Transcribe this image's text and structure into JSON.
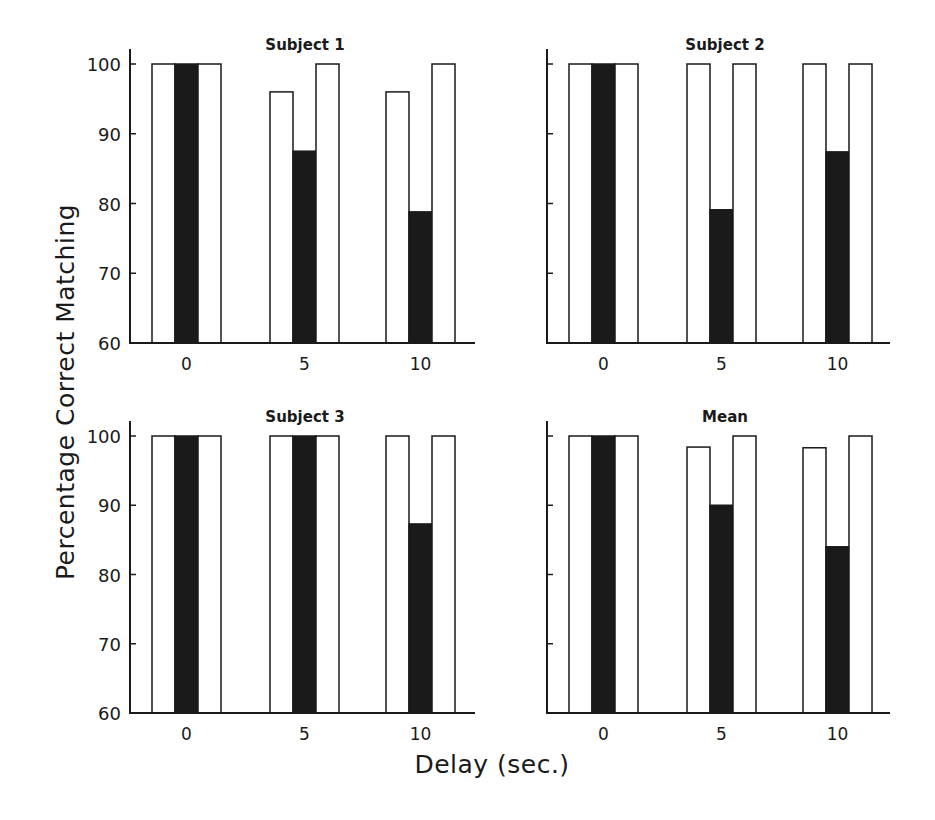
{
  "figure": {
    "ylabel": "Percentage Correct Matching",
    "xlabel": "Delay (sec.)"
  },
  "chart_data": {
    "type": "bar",
    "layout": "2x2 small multiples; each delay group has three adjacent bars (white, black, white)",
    "ylim": [
      60,
      100
    ],
    "yticks": [
      60,
      70,
      80,
      90,
      100
    ],
    "categories": [
      "0",
      "5",
      "10"
    ],
    "xlabel": "Delay (sec.)",
    "ylabel": "Percentage Correct Matching",
    "grid": false,
    "legend": null,
    "colors": {
      "open_bar": "#ffffff",
      "filled_bar": "#1a1a1a",
      "outline": "#1a1a1a"
    },
    "panels": [
      {
        "title": "Subject 1",
        "series": [
          {
            "name": "open-left",
            "fill": "white",
            "values": [
              100,
              96,
              96
            ]
          },
          {
            "name": "filled-center",
            "fill": "black",
            "values": [
              100,
              87.5,
              78.8
            ]
          },
          {
            "name": "open-right",
            "fill": "white",
            "values": [
              100,
              100,
              100
            ]
          }
        ]
      },
      {
        "title": "Subject 2",
        "series": [
          {
            "name": "open-left",
            "fill": "white",
            "values": [
              100,
              100,
              100
            ]
          },
          {
            "name": "filled-center",
            "fill": "black",
            "values": [
              100,
              79.1,
              87.4
            ]
          },
          {
            "name": "open-right",
            "fill": "white",
            "values": [
              100,
              100,
              100
            ]
          }
        ]
      },
      {
        "title": "Subject 3",
        "series": [
          {
            "name": "open-left",
            "fill": "white",
            "values": [
              100,
              100,
              100
            ]
          },
          {
            "name": "filled-center",
            "fill": "black",
            "values": [
              100,
              100,
              87.3
            ]
          },
          {
            "name": "open-right",
            "fill": "white",
            "values": [
              100,
              100,
              100
            ]
          }
        ]
      },
      {
        "title": "Mean",
        "series": [
          {
            "name": "open-left",
            "fill": "white",
            "values": [
              100,
              98.4,
              98.3
            ]
          },
          {
            "name": "filled-center",
            "fill": "black",
            "values": [
              100,
              90.0,
              84.0
            ]
          },
          {
            "name": "open-right",
            "fill": "white",
            "values": [
              100,
              100,
              100
            ]
          }
        ]
      }
    ]
  }
}
